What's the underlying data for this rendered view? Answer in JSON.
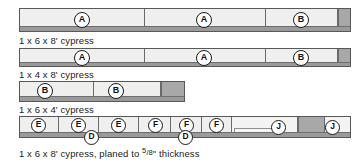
{
  "diagram": {
    "rows": [
      {
        "id": "row-1",
        "caption": "1 x 6 x 8' cypress",
        "board_stock": "1 x 6 x 8'",
        "pieces": [
          {
            "label": "A"
          },
          {
            "label": "A"
          },
          {
            "label": "B"
          }
        ],
        "waste": "offcut"
      },
      {
        "id": "row-2",
        "caption": "1 x 4 x 8' cypress",
        "board_stock": "1 x 4 x 8'",
        "pieces": [
          {
            "label": "A"
          },
          {
            "label": "A"
          },
          {
            "label": "B"
          }
        ],
        "waste": "offcut"
      },
      {
        "id": "row-3",
        "caption": "1 x 6 x 4' cypress",
        "board_stock": "1 x 6 x 4'",
        "pieces": [
          {
            "label": "B"
          },
          {
            "label": "B"
          }
        ],
        "waste": "offcut"
      },
      {
        "id": "row-4",
        "caption_pre": "1 x 6 x 8' cypress,  planed to ",
        "caption_frac_num": "5",
        "caption_frac_den": "8",
        "caption_post": "\" thickness",
        "board_stock": "1 x 6 x 8'",
        "pieces": [
          {
            "label": "E"
          },
          {
            "label": "E"
          },
          {
            "label": "E"
          },
          {
            "label": "F"
          },
          {
            "label": "F"
          },
          {
            "label": "F"
          },
          {
            "label": "J"
          },
          {
            "label": "J"
          }
        ],
        "edge_pieces": [
          {
            "label": "D"
          },
          {
            "label": "D"
          }
        ],
        "waste": "offcut"
      }
    ],
    "colors": {
      "board_face": "#e9e9e7",
      "piece_face": "#efefed",
      "waste": "#a8a8a8",
      "outline": "#58585a",
      "text": "#1b1b1b"
    }
  }
}
